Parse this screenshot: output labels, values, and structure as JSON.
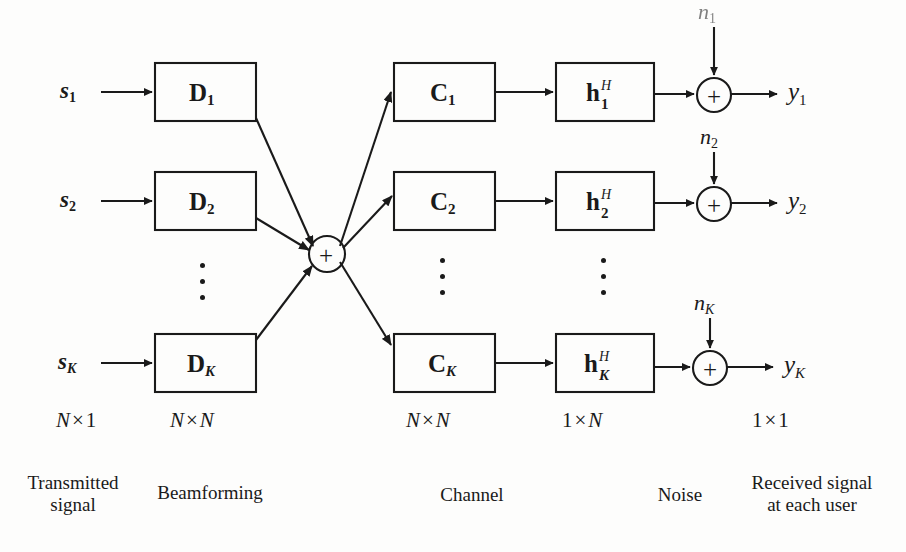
{
  "figure": {
    "type": "block-diagram",
    "background_color": "#fdfdfc",
    "line_color": "#1a1a1a"
  },
  "inputs": [
    {
      "base": "s",
      "sub": "1",
      "sub_style": "num"
    },
    {
      "base": "s",
      "sub": "2",
      "sub_style": "num"
    },
    {
      "base": "s",
      "sub": "K",
      "sub_style": "italic"
    }
  ],
  "beamforming_blocks": [
    {
      "base": "D",
      "sub": "1",
      "sub_style": "num"
    },
    {
      "base": "D",
      "sub": "2",
      "sub_style": "num"
    },
    {
      "base": "D",
      "sub": "K",
      "sub_style": "italic"
    }
  ],
  "channel_blocks": [
    {
      "base": "C",
      "sub": "1",
      "sub_style": "num"
    },
    {
      "base": "C",
      "sub": "2",
      "sub_style": "num"
    },
    {
      "base": "C",
      "sub": "K",
      "sub_style": "italic"
    }
  ],
  "channel_vector_blocks": [
    {
      "base": "h",
      "sup": "H",
      "sub": "1",
      "sub_style": "num"
    },
    {
      "base": "h",
      "sup": "H",
      "sub": "2",
      "sub_style": "num"
    },
    {
      "base": "h",
      "sup": "H",
      "sub": "K",
      "sub_style": "italic"
    }
  ],
  "noise_inputs": [
    {
      "base": "n",
      "sub": "1",
      "sub_style": "num",
      "faded": true
    },
    {
      "base": "n",
      "sub": "2",
      "sub_style": "num",
      "faded": false
    },
    {
      "base": "n",
      "sub": "K",
      "sub_style": "italic",
      "faded": false
    }
  ],
  "outputs": [
    {
      "base": "y",
      "sub": "1",
      "sub_style": "num"
    },
    {
      "base": "y",
      "sub": "2",
      "sub_style": "num"
    },
    {
      "base": "y",
      "sub": "K",
      "sub_style": "italic"
    }
  ],
  "summers": {
    "central_symbol": "+",
    "receiver_symbol": "+"
  },
  "dimensions": [
    {
      "rows": "N",
      "cols": "1",
      "cols_style": "num"
    },
    {
      "rows": "N",
      "cols": "N",
      "cols_style": "italic"
    },
    {
      "rows": "N",
      "cols": "N",
      "cols_style": "italic"
    },
    {
      "rows": "1",
      "cols": "N",
      "cols_style": "italic",
      "rows_style": "num"
    },
    {
      "rows": "1",
      "cols": "1",
      "cols_style": "num",
      "rows_style": "num"
    }
  ],
  "captions": [
    {
      "line1": "Transmitted",
      "line2": "signal"
    },
    {
      "line1": "Beamforming",
      "line2": ""
    },
    {
      "line1": "Channel",
      "line2": ""
    },
    {
      "line1": "Noise",
      "line2": ""
    },
    {
      "line1": "Received signal",
      "line2": "at each user"
    }
  ],
  "ellipses": {
    "label": "vertical-ellipsis",
    "count": 3,
    "columns": [
      "beamforming",
      "channel",
      "channel-vector"
    ]
  }
}
